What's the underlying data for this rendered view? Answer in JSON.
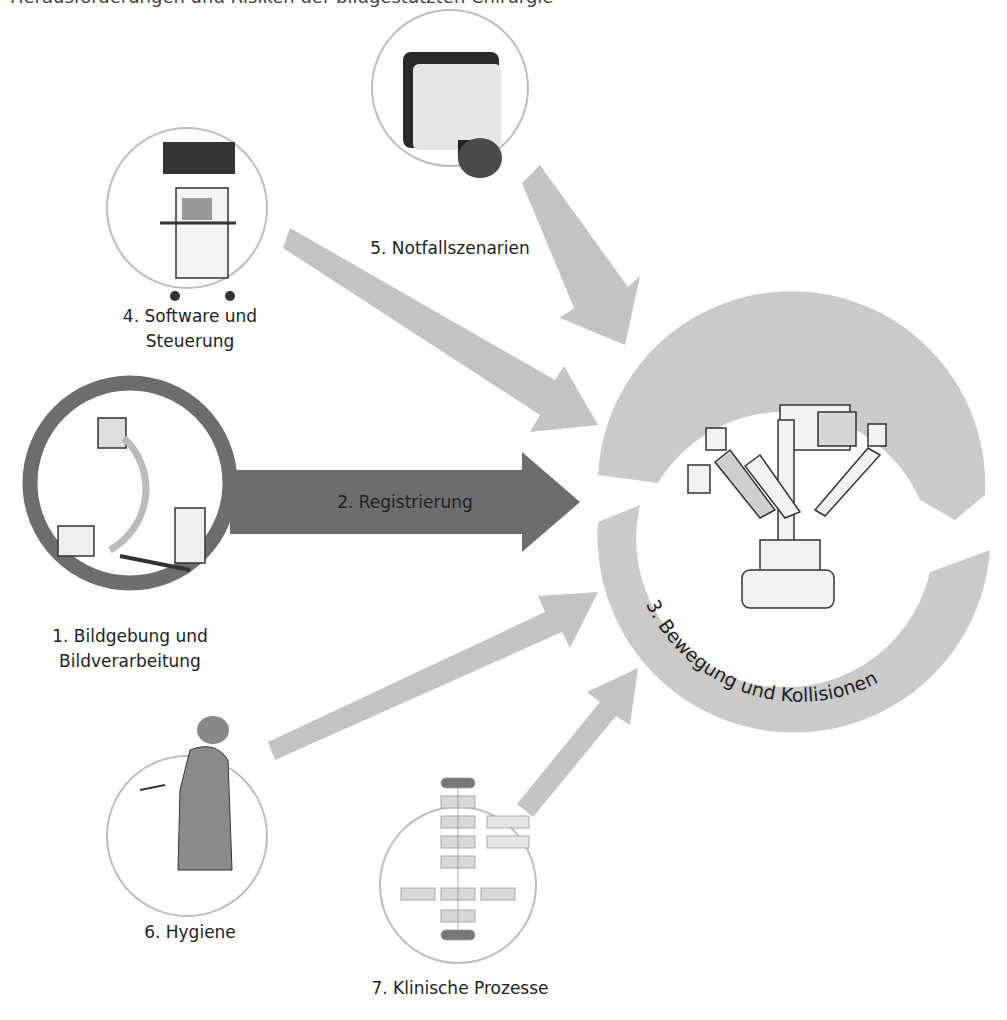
{
  "header": {
    "cut_text": "Herausforderungen und Risiken der bildgestützten Chirurgie"
  },
  "center": {
    "label": "3. Bewegung und Kollisionen",
    "icon": "surgical-robot-icon"
  },
  "nodes": [
    {
      "id": 1,
      "label_line1": "1. Bildgebung und",
      "label_line2": "Bildverarbeitung",
      "icon": "c-arm-icon",
      "highlighted": true
    },
    {
      "id": 2,
      "label": "2. Registrierung",
      "type": "arrow"
    },
    {
      "id": 4,
      "label_line1": "4. Software und",
      "label_line2": "Steuerung",
      "icon": "navigation-cart-icon"
    },
    {
      "id": 5,
      "label": "5. Notfallszenarien",
      "icon": "emergency-stop-icon"
    },
    {
      "id": 6,
      "label": "6. Hygiene",
      "icon": "surgeon-icon"
    },
    {
      "id": 7,
      "label": "7. Klinische Prozesse",
      "icon": "flowchart-icon"
    }
  ],
  "colors": {
    "dark_arrow": "#6d6d6d",
    "light_arrow": "#c4c4c4",
    "circle_outline": "#bdbdbd",
    "ring": "#cacaca"
  }
}
